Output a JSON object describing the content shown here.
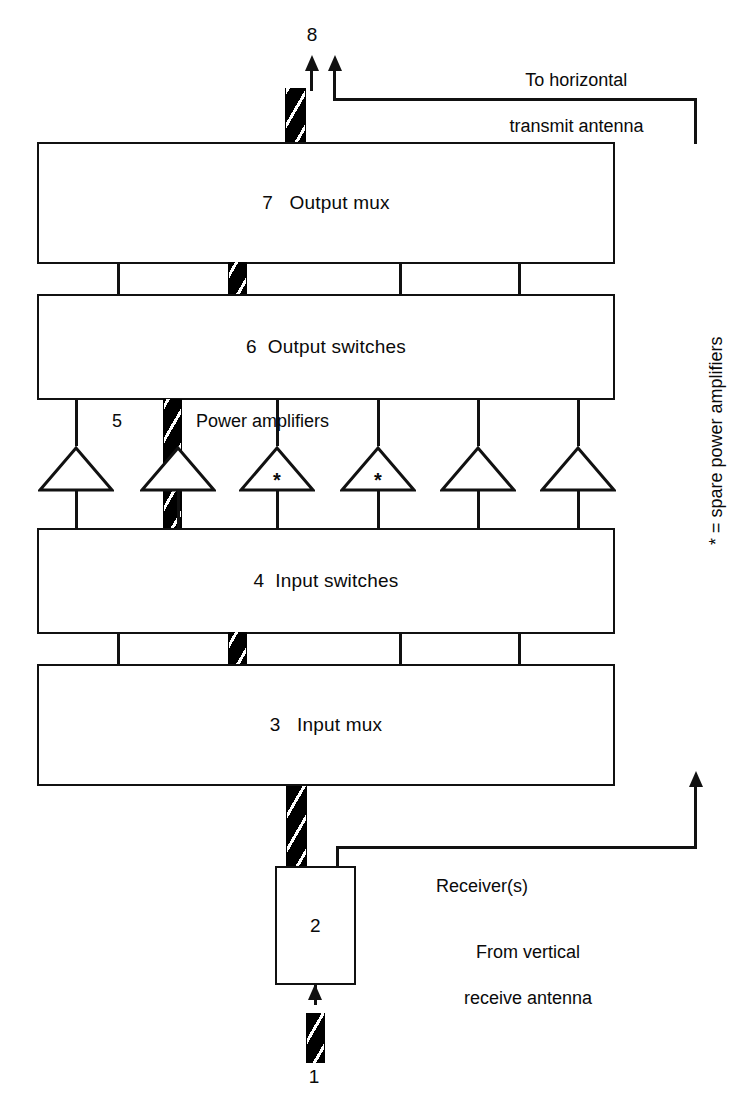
{
  "diagram": {
    "background_color": "#ffffff",
    "line_color": "#111111",
    "hatch_fill_color": "#000000"
  },
  "blocks": [
    {
      "id": "output-mux",
      "number": "7",
      "name": "Output mux",
      "label": "7   Output mux"
    },
    {
      "id": "output-switches",
      "number": "6",
      "name": "Output switches",
      "label": "6  Output switches"
    },
    {
      "id": "input-switches",
      "number": "4",
      "name": "Input switches",
      "label": "4  Input switches"
    },
    {
      "id": "input-mux",
      "number": "3",
      "name": "Input mux",
      "label": "3   Input mux"
    },
    {
      "id": "receiver",
      "number": "2",
      "name": "Receiver",
      "label": "2"
    }
  ],
  "stage_labels": {
    "power_amplifiers_number": "5",
    "power_amplifiers_text": "Power amplifiers",
    "port_8": "8",
    "port_1": "1"
  },
  "amplifiers": [
    {
      "index": 1,
      "spare": false,
      "marker": ""
    },
    {
      "index": 2,
      "spare": false,
      "marker": ""
    },
    {
      "index": 3,
      "spare": true,
      "marker": "*"
    },
    {
      "index": 4,
      "spare": true,
      "marker": "*"
    },
    {
      "index": 5,
      "spare": false,
      "marker": ""
    },
    {
      "index": 6,
      "spare": false,
      "marker": ""
    }
  ],
  "annotations": {
    "to_transmit_antenna_line1": "To horizontal",
    "to_transmit_antenna_line2": "transmit antenna",
    "receivers": "Receiver(s)",
    "from_receive_antenna_line1": "From vertical",
    "from_receive_antenna_line2": "receive antenna",
    "spare_legend": "* = spare power amplifiers"
  }
}
